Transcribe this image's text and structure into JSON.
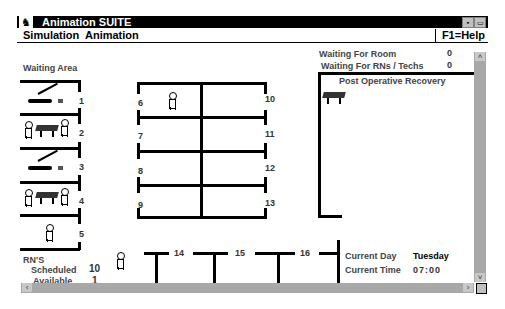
{
  "window": {
    "title": "Animation SUITE",
    "sys_icon": "app-logo-icon",
    "controls": [
      "minimize",
      "maximize"
    ]
  },
  "menu": {
    "items": [
      {
        "label": "Simulation"
      },
      {
        "label": "Animation"
      }
    ],
    "help": "F1=Help"
  },
  "status": {
    "waiting_room_label": "Waiting For Room",
    "waiting_room_value": "0",
    "waiting_rns_label": "Waiting For RNs / Techs",
    "waiting_rns_value": "0"
  },
  "waiting_area": {
    "label": "Waiting Area",
    "bays": [
      {
        "number": "1",
        "occupant": "patient-lying"
      },
      {
        "number": "2",
        "occupant": "staff-with-gurney"
      },
      {
        "number": "3",
        "occupant": "patient-lying"
      },
      {
        "number": "4",
        "occupant": "staff-with-gurney"
      },
      {
        "number": "5",
        "occupant": "staff"
      }
    ]
  },
  "rooms": {
    "left": [
      {
        "number": "6",
        "occupant": "staff"
      },
      {
        "number": "7",
        "occupant": ""
      },
      {
        "number": "8",
        "occupant": ""
      },
      {
        "number": "9",
        "occupant": ""
      }
    ],
    "right": [
      {
        "number": "10"
      },
      {
        "number": "11"
      },
      {
        "number": "12"
      },
      {
        "number": "13"
      }
    ],
    "bottom": [
      {
        "number": "14"
      },
      {
        "number": "15"
      },
      {
        "number": "16"
      }
    ]
  },
  "recovery": {
    "label": "Post Operative Recovery",
    "occupants": [
      "gurney"
    ]
  },
  "rns": {
    "label": "RN'S",
    "scheduled_label": "Scheduled",
    "scheduled_value": "10",
    "available_label": "Available",
    "available_value": "1"
  },
  "clock": {
    "day_label": "Current Day",
    "day_value": "Tuesday",
    "time_label": "Current Time",
    "time_value": "07:00"
  },
  "scrollbars": {
    "left_arrow": "‹",
    "right_arrow": "›",
    "up_arrow": "˄",
    "down_arrow": "˅"
  }
}
